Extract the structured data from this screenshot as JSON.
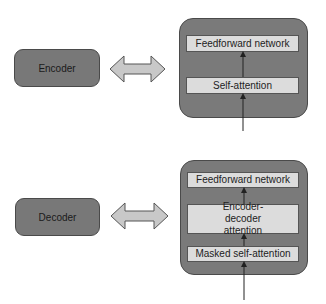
{
  "encoder": {
    "label": "Encoder",
    "layers": [
      "Feedforward network",
      "Self-attention"
    ]
  },
  "decoder": {
    "label": "Decoder",
    "layers": [
      "Feedforward network",
      "Encoder-decoder attention",
      "Masked self-attention"
    ]
  },
  "colors": {
    "block_fill": "#787878",
    "sublayer_fill": "#dcdcdc",
    "arrow_fill": "#c8c8c8",
    "stroke": "#4a4a4a"
  }
}
